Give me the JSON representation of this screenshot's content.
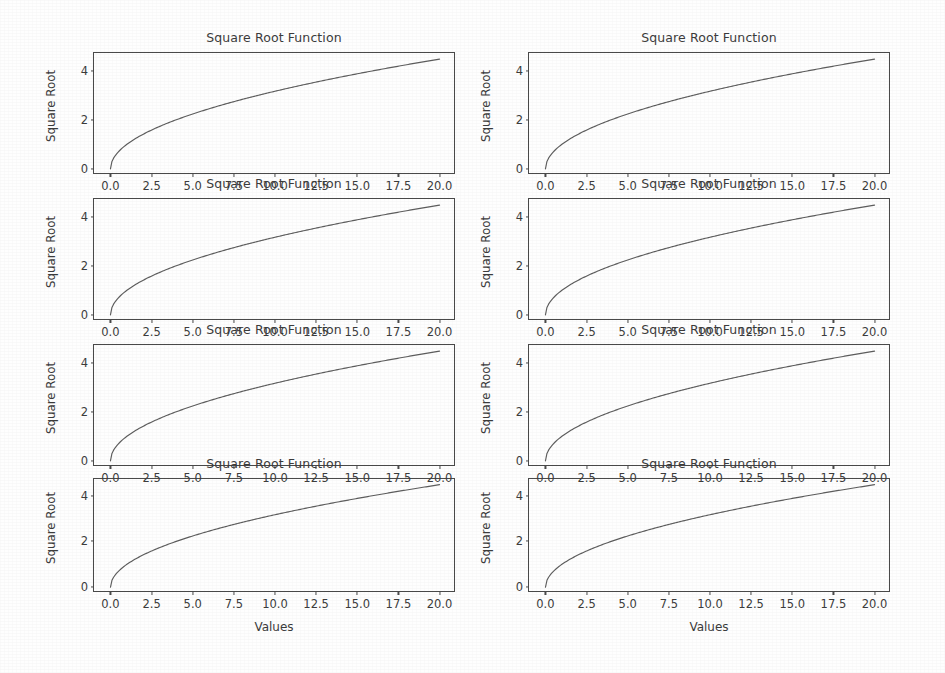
{
  "figure": {
    "width": 945,
    "height": 673,
    "background": "#ffffff",
    "rows": 4,
    "cols": 2,
    "line_color": "#5d5d5d",
    "axis_color": "#4a4a4a",
    "text_color": "#3c3c3c"
  },
  "chart_data": {
    "type": "line",
    "title": "Square Root Function",
    "xlabel": "Values",
    "ylabel": "Square Root",
    "xlim": [
      -1.0,
      21.0
    ],
    "ylim": [
      -0.25,
      4.72
    ],
    "xticks": [
      0.0,
      2.5,
      5.0,
      7.5,
      10.0,
      12.5,
      15.0,
      17.5,
      20.0
    ],
    "xticklabels": [
      "0.0",
      "2.5",
      "5.0",
      "7.5",
      "10.0",
      "12.5",
      "15.0",
      "17.5",
      "20.0"
    ],
    "yticks": [
      0,
      2,
      4
    ],
    "yticklabels": [
      "0",
      "2",
      "4"
    ],
    "grid": false,
    "legend": null,
    "x": [
      0,
      1,
      2,
      3,
      4,
      5,
      6,
      7,
      8,
      9,
      10,
      11,
      12,
      13,
      14,
      15,
      16,
      17,
      18,
      19,
      20
    ],
    "series": [
      {
        "name": "sqrt(x)",
        "values": [
          0.0,
          1.0,
          1.414,
          1.732,
          2.0,
          2.236,
          2.449,
          2.646,
          2.828,
          3.0,
          3.162,
          3.317,
          3.464,
          3.606,
          3.742,
          3.873,
          4.0,
          4.123,
          4.243,
          4.359,
          4.472
        ]
      }
    ],
    "panels": [
      {
        "id": "panel-r1c1",
        "row": 1,
        "col": 1,
        "title": "Square Root Function",
        "ylabel": "Square Root",
        "xlabel": ""
      },
      {
        "id": "panel-r1c2",
        "row": 1,
        "col": 2,
        "title": "Square Root Function",
        "ylabel": "Square Root",
        "xlabel": ""
      },
      {
        "id": "panel-r2c1",
        "row": 2,
        "col": 1,
        "title": "Square Root Function",
        "ylabel": "Square Root",
        "xlabel": ""
      },
      {
        "id": "panel-r2c2",
        "row": 2,
        "col": 2,
        "title": "Square Root Function",
        "ylabel": "Square Root",
        "xlabel": ""
      },
      {
        "id": "panel-r3c1",
        "row": 3,
        "col": 1,
        "title": "Square Root Function",
        "ylabel": "Square Root",
        "xlabel": ""
      },
      {
        "id": "panel-r3c2",
        "row": 3,
        "col": 2,
        "title": "Square Root Function",
        "ylabel": "Square Root",
        "xlabel": ""
      },
      {
        "id": "panel-r4c1",
        "row": 4,
        "col": 1,
        "title": "Square Root Function",
        "ylabel": "Square Root",
        "xlabel": "Values"
      },
      {
        "id": "panel-r4c2",
        "row": 4,
        "col": 2,
        "title": "Square Root Function",
        "ylabel": "Square Root",
        "xlabel": "Values"
      }
    ]
  },
  "panels": {
    "p0": {
      "title": "Square Root Function",
      "ylabel": "Square Root",
      "xlabel": ""
    },
    "p1": {
      "title": "Square Root Function",
      "ylabel": "Square Root",
      "xlabel": ""
    },
    "p2": {
      "title": "Square Root Function",
      "ylabel": "Square Root",
      "xlabel": ""
    },
    "p3": {
      "title": "Square Root Function",
      "ylabel": "Square Root",
      "xlabel": ""
    },
    "p4": {
      "title": "Square Root Function",
      "ylabel": "Square Root",
      "xlabel": ""
    },
    "p5": {
      "title": "Square Root Function",
      "ylabel": "Square Root",
      "xlabel": ""
    },
    "p6": {
      "title": "Square Root Function",
      "ylabel": "Square Root",
      "xlabel": "Values"
    },
    "p7": {
      "title": "Square Root Function",
      "ylabel": "Square Root",
      "xlabel": "Values"
    }
  }
}
